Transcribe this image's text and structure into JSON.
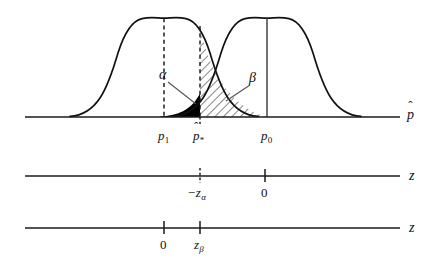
{
  "figure": {
    "type": "statistical-error-diagram",
    "background_color": "#ffffff",
    "ink_color": "#111111",
    "alpha_region_color": "#000000",
    "beta_region_fill": "diagonal-hatch"
  },
  "curves": [
    {
      "name": "alternative-distribution",
      "center_label": "p_1",
      "peak_x": 164,
      "peak_y": 18,
      "sd_px": 38,
      "center_line_style": "dashed"
    },
    {
      "name": "null-distribution",
      "center_label": "p_0",
      "peak_x": 267,
      "peak_y": 18,
      "sd_px": 38,
      "center_line_style": "solid"
    }
  ],
  "critical_value": {
    "label": "p-hat-star",
    "x": 200,
    "line_style": "dashed"
  },
  "regions": [
    {
      "name": "alpha-region",
      "label": "α",
      "meaning": "Type I error probability",
      "fill": "solid-black",
      "from_x": 162,
      "to_x": 200,
      "under_curve": "alternative-distribution"
    },
    {
      "name": "beta-region",
      "label": "β",
      "meaning": "Type II error probability",
      "fill": "diagonal-hatch",
      "from_x": 200,
      "to_x": 267,
      "under_curve": "null-distribution"
    }
  ],
  "annotations": {
    "alpha_label": "α",
    "beta_label": "β"
  },
  "axes": [
    {
      "name": "phat-axis",
      "axis_label": "p",
      "axis_label_has_hat": true,
      "baseline_y": 117,
      "x_start": 25,
      "x_end": 400,
      "ticks": [
        {
          "label_base": "p",
          "label_sub": "1",
          "has_hat": false,
          "x": 164,
          "style": "none"
        },
        {
          "label_base": "p",
          "label_sub": "*",
          "has_hat": true,
          "x": 200,
          "style": "dashed"
        },
        {
          "label_base": "p",
          "label_sub": "0",
          "has_hat": false,
          "x": 267,
          "style": "none"
        }
      ]
    },
    {
      "name": "z-axis-alternative",
      "axis_label": "z",
      "axis_label_has_hat": false,
      "baseline_y": 176,
      "x_start": 25,
      "x_end": 400,
      "ticks": [
        {
          "label_base": "−z",
          "label_sub": "α",
          "has_hat": false,
          "x": 200,
          "style": "dashed"
        },
        {
          "label_base": "0",
          "label_sub": "",
          "has_hat": false,
          "x": 265,
          "style": "solid"
        }
      ]
    },
    {
      "name": "z-axis-null",
      "axis_label": "z",
      "axis_label_has_hat": false,
      "baseline_y": 228,
      "x_start": 25,
      "x_end": 400,
      "ticks": [
        {
          "label_base": "0",
          "label_sub": "",
          "has_hat": false,
          "x": 164,
          "style": "solid"
        },
        {
          "label_base": "z",
          "label_sub": "β",
          "has_hat": false,
          "x": 200,
          "style": "solid"
        }
      ]
    }
  ],
  "labels": {
    "phat_axis_label": "p",
    "z_axis_label_1": "z",
    "z_axis_label_2": "z",
    "p1": "p",
    "p1_sub": "1",
    "pstar": "p",
    "pstar_sub": "*",
    "p0": "p",
    "p0_sub": "0",
    "neg_z_alpha": "−z",
    "neg_z_alpha_sub": "α",
    "zero_mid": "0",
    "zero_low": "0",
    "z_beta": "z",
    "z_beta_sub": "β",
    "hat_mark": "ˆ"
  }
}
